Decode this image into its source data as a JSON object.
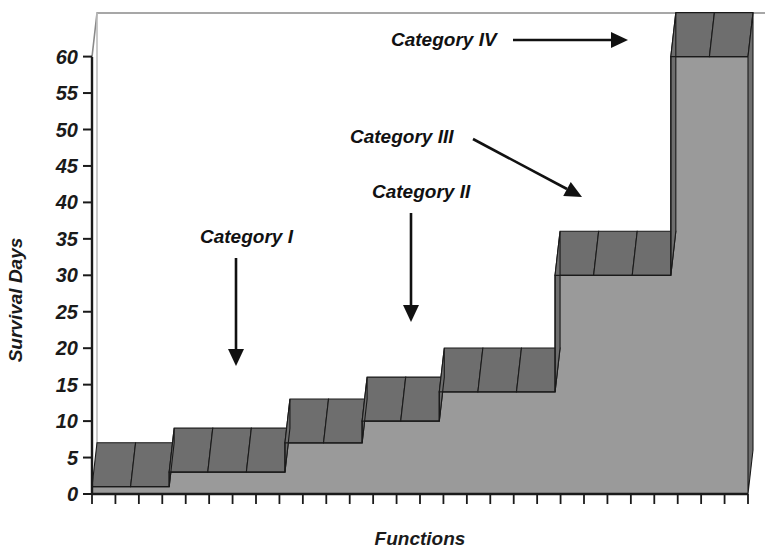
{
  "chart_data": {
    "type": "area",
    "title": "",
    "xlabel": "Functions",
    "ylabel": "Survival Days",
    "ylim": [
      0,
      65
    ],
    "xlim": [
      0,
      17
    ],
    "grid": false,
    "legend": "none",
    "ytick_labels": [
      "0",
      "5",
      "10",
      "15",
      "20",
      "25",
      "30",
      "35",
      "40",
      "45",
      "50",
      "55",
      "60"
    ],
    "ytick_values": [
      0,
      5,
      10,
      15,
      20,
      25,
      30,
      35,
      40,
      45,
      50,
      55,
      60
    ],
    "xtick_labels": [],
    "xtick_count": 29,
    "categories": [
      "f1",
      "f2",
      "f3",
      "f4",
      "f5",
      "f6",
      "f7",
      "f8",
      "f9",
      "f10",
      "f11",
      "f12",
      "f13",
      "f14",
      "f15",
      "f16",
      "f17"
    ],
    "values": [
      1,
      1,
      3,
      3,
      3,
      7,
      7,
      10,
      10,
      14,
      14,
      14,
      30,
      30,
      30,
      60,
      60
    ],
    "annotations": [
      {
        "label": "Category I",
        "label_x": 200,
        "label_y": 243,
        "arrow": "down",
        "x1": 236,
        "y1": 258,
        "x2": 236,
        "y2": 366
      },
      {
        "label": "Category II",
        "label_x": 372,
        "label_y": 198,
        "arrow": "down",
        "x1": 411,
        "y1": 213,
        "x2": 411,
        "y2": 322
      },
      {
        "label": "Category III",
        "label_x": 350,
        "label_y": 143,
        "arrow": "diagonal",
        "x1": 473,
        "y1": 139,
        "x2": 582,
        "y2": 197
      },
      {
        "label": "Category IV",
        "label_x": 391,
        "label_y": 46,
        "arrow": "right",
        "x1": 513,
        "y1": 40,
        "x2": 628,
        "y2": 40
      }
    ]
  },
  "colors": {
    "front_face": "#9a9a9a",
    "top_face": "#6e6e6e",
    "side_face": "#6e6e6e",
    "outline": "#1a1a1a",
    "axis": "#1a1a1a",
    "wall": "#b3b3b3",
    "background": "#ffffff"
  }
}
